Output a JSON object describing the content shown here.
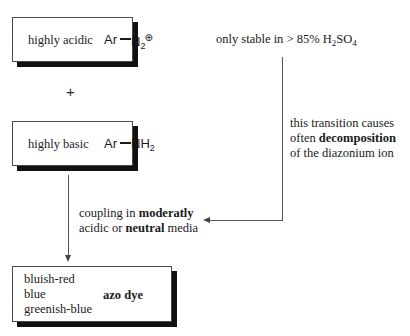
{
  "diagram": {
    "background_color": "#ffffff",
    "boxes": [
      {
        "id": "diazonium",
        "phase_label": "highly acidic",
        "formula_left": "Ar",
        "formula_right": "N",
        "formula_sub": "2",
        "formula_charge": "⊕"
      },
      {
        "id": "amine",
        "phase_label": "highly basic",
        "formula_left": "Ar",
        "formula_right": "NH",
        "formula_sub": "2",
        "formula_charge": ""
      }
    ],
    "plus_symbol": "+",
    "stability_note": {
      "text_before": "only stable in > 85% H",
      "sub": "2",
      "text_mid": "SO",
      "sub2": "4"
    },
    "decomposition_note": {
      "line1": "this transition causes",
      "line2_prefix": "often ",
      "line2_bold": "decomposition",
      "line3": "of the diazonium ion"
    },
    "coupling_note": {
      "line1_prefix": "coupling in ",
      "line1_bold": "moderatly",
      "line2_prefix": "acidic or ",
      "line2_bold": "neutral",
      "line2_suffix": " media"
    },
    "product_box": {
      "colors": [
        "bluish-red",
        "blue",
        "greenish-blue"
      ],
      "product_label": "azo dye"
    },
    "connectors": {
      "down_arrow_name": "reaction-arrow-down",
      "elbow_arrow_name": "decomposition-elbow-arrow"
    }
  }
}
